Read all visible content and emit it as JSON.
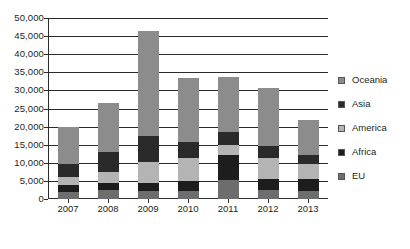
{
  "chart_data": {
    "type": "bar",
    "stacked": true,
    "title": "",
    "subtitle": "",
    "xlabel": "",
    "ylabel": "",
    "categories": [
      "2007",
      "2008",
      "2009",
      "2010",
      "2011",
      "2012",
      "2013"
    ],
    "ylim": [
      0,
      50000
    ],
    "ytick_values": [
      0,
      5000,
      10000,
      15000,
      20000,
      25000,
      30000,
      35000,
      40000,
      45000,
      50000
    ],
    "ytick_labels": [
      "0",
      "5,000",
      "10,000",
      "15,000",
      "20,000",
      "25,000",
      "30,000",
      "35,000",
      "40,000",
      "45,000",
      "50,000"
    ],
    "grid": true,
    "legend_position": "right",
    "series": [
      {
        "name": "EU",
        "color": "#6d6d6d",
        "values": [
          2000,
          2400,
          2300,
          2200,
          5300,
          2400,
          2100
        ]
      },
      {
        "name": "Africa",
        "color": "#1d1d1d",
        "values": [
          1800,
          2000,
          2100,
          2700,
          6900,
          3100,
          3300
        ]
      },
      {
        "name": "America",
        "color": "#b4b4b4",
        "values": [
          2200,
          3000,
          5800,
          6300,
          2800,
          5900,
          4400
        ]
      },
      {
        "name": "Asia",
        "color": "#2a2a2a",
        "values": [
          3700,
          5700,
          7200,
          4500,
          3600,
          3300,
          2400
        ]
      },
      {
        "name": "Oceania",
        "color": "#8c8c8c",
        "values": [
          10300,
          13400,
          28900,
          17800,
          15000,
          16100,
          9600
        ]
      }
    ],
    "totals": [
      20000,
      26500,
      46300,
      33500,
      33600,
      30800,
      21800
    ]
  },
  "legend": {
    "entries": [
      {
        "label": "Oceania",
        "color": "#8c8c8c"
      },
      {
        "label": "Asia",
        "color": "#2a2a2a"
      },
      {
        "label": "America",
        "color": "#b4b4b4"
      },
      {
        "label": "Africa",
        "color": "#1d1d1d"
      },
      {
        "label": "EU",
        "color": "#6d6d6d"
      }
    ]
  }
}
